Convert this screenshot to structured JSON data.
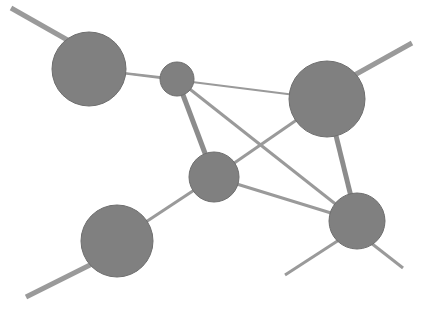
{
  "figure": {
    "kind": "network-graph",
    "width": 421,
    "height": 310,
    "background_color": "#ffffff",
    "node_fill_color": "#808080",
    "node_stroke_color": "#6e6e6e",
    "edge_color": "#9a9a9a",
    "edge_thick_color": "#8c8c8c"
  },
  "chart_data": {
    "type": "scatter",
    "title": "",
    "xlabel": "",
    "ylabel": "",
    "xlim": [
      0,
      421
    ],
    "ylim": [
      0,
      310
    ],
    "grid": false,
    "legend": "none",
    "nodes": [
      {
        "id": "n1",
        "label": "top-left-node",
        "x": 89,
        "y": 69,
        "r": 37,
        "degree": 3
      },
      {
        "id": "n2",
        "label": "small-center-node",
        "x": 177,
        "y": 79,
        "r": 17,
        "degree": 3
      },
      {
        "id": "n3",
        "label": "top-right-node",
        "x": 327,
        "y": 99,
        "r": 38,
        "degree": 4
      },
      {
        "id": "n4",
        "label": "middle-node",
        "x": 214,
        "y": 177,
        "r": 25,
        "degree": 4
      },
      {
        "id": "n5",
        "label": "bottom-right-node",
        "x": 357,
        "y": 221,
        "r": 28,
        "degree": 5
      },
      {
        "id": "n6",
        "label": "bottom-left-node",
        "x": 117,
        "y": 241,
        "r": 36,
        "degree": 2
      }
    ],
    "edges": [
      {
        "id": "e1",
        "source": "n1",
        "target": "n3",
        "weight": 1,
        "width": 2
      },
      {
        "id": "e2",
        "source": "n1",
        "target": "n2",
        "weight": 1,
        "width": 2
      },
      {
        "id": "e3",
        "source": "n2",
        "target": "n4",
        "weight": 2,
        "width": 5
      },
      {
        "id": "e4",
        "source": "n2",
        "target": "n5",
        "weight": 1,
        "width": 3
      },
      {
        "id": "e5",
        "source": "n3",
        "target": "n4",
        "weight": 1,
        "width": 3
      },
      {
        "id": "e6",
        "source": "n3",
        "target": "n5",
        "weight": 2,
        "width": 5
      },
      {
        "id": "e7",
        "source": "n4",
        "target": "n5",
        "weight": 1,
        "width": 3
      },
      {
        "id": "e8",
        "source": "n4",
        "target": "n6",
        "weight": 1,
        "width": 3
      }
    ],
    "pendant_edges": [
      {
        "id": "p1",
        "source": "n1",
        "x1": 11,
        "y1": 8,
        "x2": 71,
        "y2": 42,
        "width": 5,
        "label": "stub-top-left"
      },
      {
        "id": "p2",
        "source": "n3",
        "x1": 412,
        "y1": 43,
        "x2": 351,
        "y2": 77,
        "width": 5,
        "label": "stub-top-right"
      },
      {
        "id": "p3",
        "source": "n6",
        "x1": 26,
        "y1": 297,
        "x2": 96,
        "y2": 262,
        "width": 5,
        "label": "stub-bottom-left"
      },
      {
        "id": "p4",
        "source": "n5",
        "x1": 285,
        "y1": 275,
        "x2": 339,
        "y2": 240,
        "width": 3,
        "label": "stub-bottom-center"
      },
      {
        "id": "p5",
        "source": "n5",
        "x1": 403,
        "y1": 268,
        "x2": 371,
        "y2": 243,
        "width": 3,
        "label": "stub-bottom-right"
      }
    ]
  }
}
